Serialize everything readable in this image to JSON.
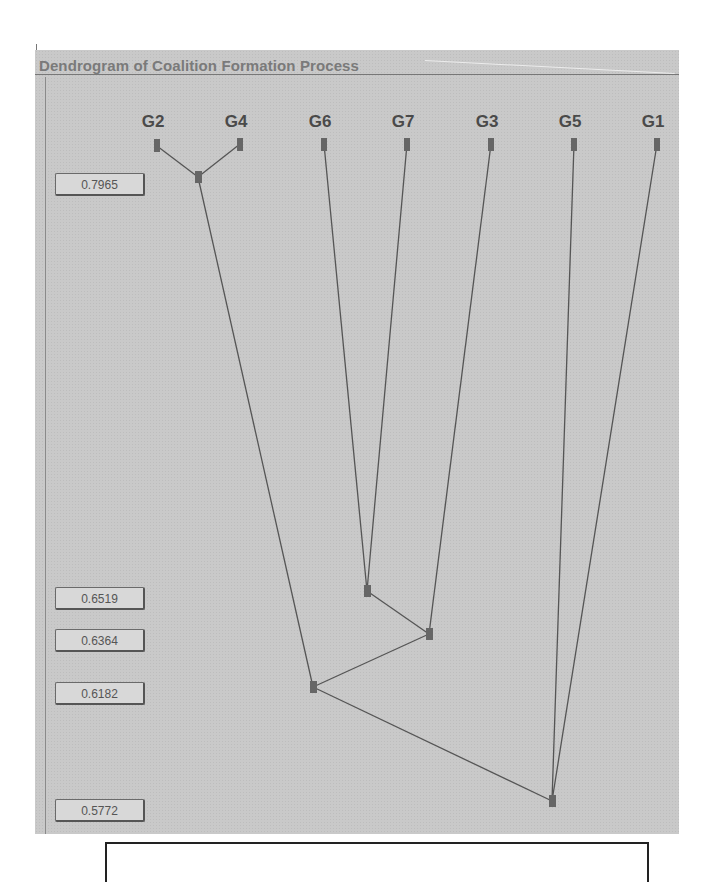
{
  "panel": {
    "title": "Dendrogram of Coalition Formation Process"
  },
  "leaves": [
    {
      "id": "G2",
      "x": 157
    },
    {
      "id": "G4",
      "x": 240
    },
    {
      "id": "G6",
      "x": 324
    },
    {
      "id": "G7",
      "x": 407
    },
    {
      "id": "G3",
      "x": 491
    },
    {
      "id": "G5",
      "x": 574
    },
    {
      "id": "G1",
      "x": 657
    }
  ],
  "levels": [
    {
      "value": "0.7965",
      "y": 184
    },
    {
      "value": "0.6519",
      "y": 598
    },
    {
      "value": "0.6364",
      "y": 640
    },
    {
      "value": "0.6182",
      "y": 692
    },
    {
      "value": "0.5772",
      "y": 810
    }
  ],
  "merges": [
    {
      "members": [
        "G2",
        "G4"
      ],
      "similarity": 0.7965
    },
    {
      "members": [
        "G6",
        "G7"
      ],
      "similarity": 0.6519
    },
    {
      "members": [
        "G6G7",
        "G3"
      ],
      "similarity": 0.6364
    },
    {
      "members": [
        "G2G4",
        "G6G7G3"
      ],
      "similarity": 0.6182
    },
    {
      "members": [
        "G2G4G6G7G3",
        "G5",
        "G1"
      ],
      "similarity": 0.5772
    }
  ],
  "colors": {
    "panel_bg": "#c9c9c9",
    "line": "#555555",
    "node": "#666666",
    "title": "#7a7a7a"
  }
}
